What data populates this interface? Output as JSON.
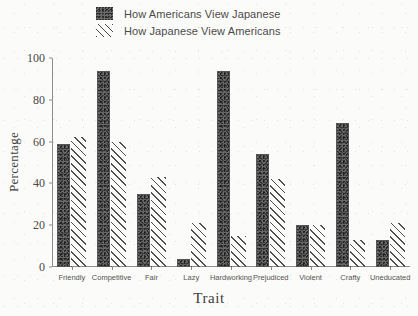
{
  "chart_data": {
    "type": "bar",
    "title": "",
    "subtitle": "",
    "xlabel": "Trait",
    "ylabel": "Percentage",
    "ylim": [
      0,
      100
    ],
    "yticks": [
      0,
      20,
      40,
      60,
      80,
      100
    ],
    "grid": false,
    "legend_position": "top",
    "categories": [
      "Friendly",
      "Competitive",
      "Fair",
      "Lazy",
      "Hardworking",
      "Prejudiced",
      "Violent",
      "Crafty",
      "Uneducated"
    ],
    "series": [
      {
        "name": "How Americans View Japanese",
        "fill": "stipple-gray",
        "color": "#686868",
        "values": [
          59,
          94,
          35,
          4,
          94,
          54,
          20,
          69,
          13
        ]
      },
      {
        "name": "How Japanese View Americans",
        "fill": "diagonal-hatch",
        "color": "#4f4f4f",
        "values": [
          62,
          60,
          43,
          21,
          15,
          42,
          20,
          13,
          21
        ]
      }
    ]
  },
  "legend": {
    "items": [
      {
        "label": "How Americans View Japanese",
        "swatch": "stipple-square-icon"
      },
      {
        "label": "How Japanese View Americans",
        "swatch": "hatch-square-icon"
      }
    ]
  },
  "axes": {
    "y_title": "Percentage",
    "x_title": "Trait",
    "y_tick_labels": [
      "0",
      "20",
      "40",
      "60",
      "80",
      "100"
    ],
    "x_tick_labels": [
      "Friendly",
      "Competitive",
      "Fair",
      "Lazy",
      "Hardworking",
      "Prejudiced",
      "Violent",
      "Crafty",
      "Uneducated"
    ]
  }
}
